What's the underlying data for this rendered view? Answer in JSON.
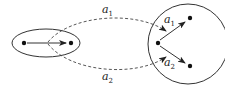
{
  "diagram": {
    "labels": {
      "top_curve": {
        "base": "a",
        "sub": "1"
      },
      "bottom_curve": {
        "base": "a",
        "sub": "2"
      },
      "inner_upper": {
        "base": "a",
        "sub": "1"
      },
      "inner_lower": {
        "base": "a",
        "sub": "2"
      }
    },
    "colors": {
      "stroke": "#333333",
      "dot": "#111111",
      "background": "#ffffff"
    }
  }
}
